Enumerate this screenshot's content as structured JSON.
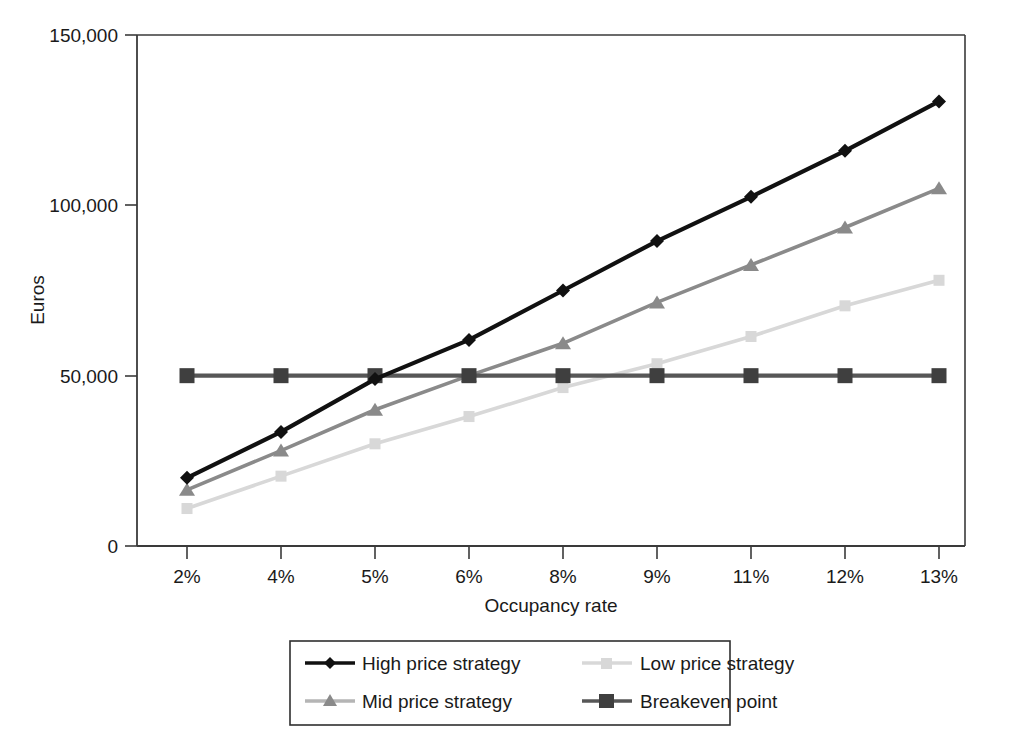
{
  "chart_data": {
    "type": "line",
    "title": "",
    "xlabel": "Occupancy rate",
    "ylabel": "Euros",
    "categories": [
      "2%",
      "4%",
      "5%",
      "6%",
      "8%",
      "9%",
      "11%",
      "12%",
      "13%"
    ],
    "ylim": [
      0,
      150000
    ],
    "yticks": [
      0,
      50000,
      100000,
      150000
    ],
    "ytick_labels": [
      "0",
      "50,000",
      "100,000",
      "150,000"
    ],
    "grid": false,
    "legend_position": "bottom",
    "series": [
      {
        "name": "High price strategy",
        "marker": "diamond",
        "color": "#111111",
        "values": [
          20000,
          33500,
          49000,
          60500,
          75000,
          89500,
          102500,
          116000,
          130500
        ]
      },
      {
        "name": "Mid price strategy",
        "marker": "triangle",
        "color": "#8a8a8a",
        "values": [
          16500,
          28000,
          40000,
          50000,
          59500,
          71500,
          82500,
          93500,
          105000
        ]
      },
      {
        "name": "Low price strategy",
        "marker": "square",
        "color": "#d8d8d8",
        "values": [
          11000,
          20500,
          30000,
          38000,
          46500,
          53500,
          61500,
          70500,
          78000
        ]
      },
      {
        "name": "Breakeven point",
        "marker": "square",
        "color": "#575757",
        "values": [
          50000,
          50000,
          50000,
          50000,
          50000,
          50000,
          50000,
          50000,
          50000
        ]
      }
    ],
    "legend_entries": [
      "High price strategy",
      "Low price strategy",
      "Mid price strategy",
      "Breakeven point"
    ]
  },
  "axes": {
    "y_title": "Euros",
    "x_title": "Occupancy rate",
    "y_tick_0": "0",
    "y_tick_1": "50,000",
    "y_tick_2": "100,000",
    "y_tick_3": "150,000",
    "x_tick_0": "2%",
    "x_tick_1": "4%",
    "x_tick_2": "5%",
    "x_tick_3": "6%",
    "x_tick_4": "8%",
    "x_tick_5": "9%",
    "x_tick_6": "11%",
    "x_tick_7": "12%",
    "x_tick_8": "13%"
  },
  "legend": {
    "item_0": "High price strategy",
    "item_1": "Low price strategy",
    "item_2": "Mid price strategy",
    "item_3": "Breakeven point"
  },
  "colors": {
    "high": "#111111",
    "mid": "#8a8a8a",
    "low": "#d8d8d8",
    "breakeven": "#575757",
    "axis": "#3a3a3a",
    "background": "#ffffff"
  }
}
